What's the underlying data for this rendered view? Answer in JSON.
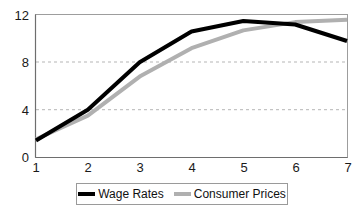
{
  "chart_data": {
    "type": "line",
    "title": "",
    "subtitle": "",
    "xlabel": "",
    "ylabel": "",
    "x": [
      1,
      2,
      3,
      4,
      5,
      6,
      7
    ],
    "xtick_labels": [
      "1",
      "2",
      "3",
      "4",
      "5",
      "6",
      "7"
    ],
    "ytick_labels": [
      "0",
      "4",
      "8",
      "12"
    ],
    "yticks": [
      0,
      4,
      8,
      12
    ],
    "ylim": [
      0,
      12
    ],
    "xlim": [
      1,
      7
    ],
    "grid": "horizontal-dashed",
    "legend_position": "bottom-center",
    "series": [
      {
        "name": "Wage Rates",
        "color": "#000000",
        "values": [
          1.4,
          4.0,
          8.0,
          10.6,
          11.5,
          11.2,
          9.8
        ]
      },
      {
        "name": "Consumer Prices",
        "color": "#b0b0b0",
        "values": [
          1.5,
          3.5,
          6.8,
          9.2,
          10.7,
          11.4,
          11.6
        ]
      }
    ]
  },
  "axes": {
    "y_ticks": [
      {
        "label": "12",
        "value": 12
      },
      {
        "label": "8",
        "value": 8
      },
      {
        "label": "4",
        "value": 4
      },
      {
        "label": "0",
        "value": 0
      }
    ],
    "x_ticks": [
      {
        "label": "1",
        "value": 1
      },
      {
        "label": "2",
        "value": 2
      },
      {
        "label": "3",
        "value": 3
      },
      {
        "label": "4",
        "value": 4
      },
      {
        "label": "5",
        "value": 5
      },
      {
        "label": "6",
        "value": 6
      },
      {
        "label": "7",
        "value": 7
      }
    ]
  },
  "legend": {
    "items": [
      {
        "label": "Wage Rates",
        "color": "#000000"
      },
      {
        "label": "Consumer Prices",
        "color": "#b0b0b0"
      }
    ]
  },
  "colors": {
    "wage_rates": "#000000",
    "consumer_prices": "#b0b0b0",
    "axis": "#808080",
    "gridline": "#b5b5b5",
    "background": "#ffffff",
    "text": "#1a1a1a"
  }
}
